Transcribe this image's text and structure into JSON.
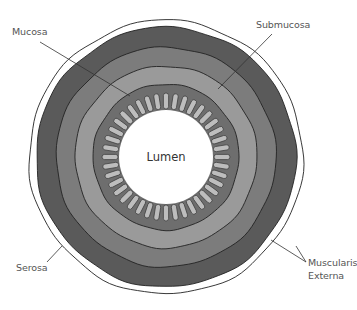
{
  "diagram": {
    "center_label": "Lumen",
    "labels": {
      "mucosa": "Mucosa",
      "submucosa": "Submucosa",
      "serosa": "Serosa",
      "muscularis_line1": "Muscularis",
      "muscularis_line2": "Externa"
    },
    "layers_outer_to_inner": [
      {
        "name": "Serosa",
        "color": "#ffffff"
      },
      {
        "name": "Muscularis Externa (outer longitudinal)",
        "color": "#5a5a5a"
      },
      {
        "name": "Muscularis Externa (inner circular)",
        "color": "#7c7c7c"
      },
      {
        "name": "Submucosa",
        "color": "#9a9a9a"
      },
      {
        "name": "Mucosa",
        "color": "#6e6e6e"
      },
      {
        "name": "Villi",
        "color": "#bdbdbd"
      },
      {
        "name": "Lumen",
        "color": "#ffffff"
      }
    ],
    "outline_color": "#222222"
  }
}
